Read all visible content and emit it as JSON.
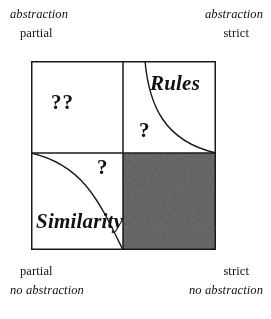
{
  "figure": {
    "kind": "2x2-conceptual-matrix"
  },
  "axis_labels": {
    "top_left": {
      "abstraction_line": "abstraction",
      "degree_line": "partial"
    },
    "top_right": {
      "abstraction_line": "abstraction",
      "degree_line": "strict"
    },
    "bottom_left": {
      "degree_line": "partial",
      "abstraction_line": "no abstraction"
    },
    "bottom_right": {
      "degree_line": "strict",
      "abstraction_line": "no abstraction"
    }
  },
  "quadrants": {
    "top_left": {
      "name": "partial-abstraction-partial-match",
      "marker": "??",
      "fill": "#ffffff",
      "has_curve": false
    },
    "top_right": {
      "name": "rules",
      "region_label": "Rules",
      "marker": "?",
      "fill": "#ffffff",
      "has_curve": true
    },
    "bottom_left": {
      "name": "similarity",
      "region_label": "Similarity",
      "marker": "?",
      "fill": "#ffffff",
      "has_curve": true
    },
    "bottom_right": {
      "name": "shaded-excluded-region",
      "marker": "",
      "fill": "#6b6b6b",
      "has_curve": false
    }
  },
  "colors": {
    "stroke": "#1a1a1a",
    "background": "#ffffff",
    "shaded_fill": "#6f6f6f",
    "shaded_speckle_dark": "#2b2b2b",
    "text": "#111111"
  },
  "geometry": {
    "box_left": 31,
    "box_top": 61,
    "box_width": 185,
    "box_height": 189,
    "center_x": 92,
    "center_y": 92
  }
}
